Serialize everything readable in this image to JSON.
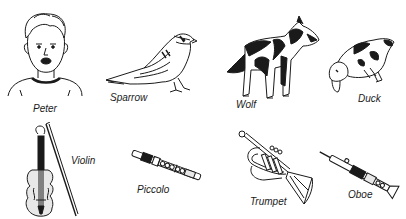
{
  "illustration": {
    "characters": [
      {
        "id": "peter",
        "label": "Peter",
        "icon": "boy-portrait"
      },
      {
        "id": "sparrow",
        "label": "Sparrow",
        "icon": "sparrow-bird"
      },
      {
        "id": "wolf",
        "label": "Wolf",
        "icon": "wolf"
      },
      {
        "id": "duck",
        "label": "Duck",
        "icon": "duck"
      }
    ],
    "instruments": [
      {
        "id": "violin",
        "label": "Violin",
        "icon": "violin"
      },
      {
        "id": "piccolo",
        "label": "Piccolo",
        "icon": "piccolo"
      },
      {
        "id": "trumpet",
        "label": "Trumpet",
        "icon": "trumpet"
      },
      {
        "id": "oboe",
        "label": "Oboe",
        "icon": "oboe"
      }
    ]
  },
  "colors": {
    "ink": "#1a1a1a",
    "background": "#ffffff",
    "fill_light": "#e8e8e8"
  }
}
